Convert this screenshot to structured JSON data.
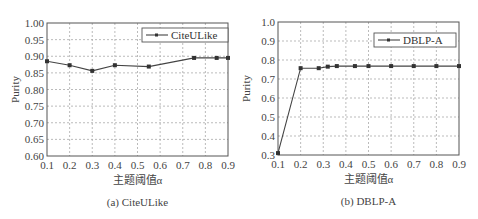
{
  "chart_data": [
    {
      "type": "line",
      "title": "",
      "caption": "(a) CiteULike",
      "xlabel": "主题阈值α",
      "ylabel": "Purity",
      "xlim": [
        0.1,
        0.9
      ],
      "ylim": [
        0.6,
        1.0
      ],
      "xticks": [
        "0.1",
        "0.2",
        "0.3",
        "0.4",
        "0.5",
        "0.6",
        "0.7",
        "0.8",
        "0.9"
      ],
      "yticks": [
        "0.60",
        "0.65",
        "0.70",
        "0.75",
        "0.80",
        "0.85",
        "0.90",
        "0.95",
        "1.00"
      ],
      "grid": true,
      "legend_position": "upper right",
      "series": [
        {
          "name": "CiteULike",
          "x": [
            0.1,
            0.2,
            0.3,
            0.4,
            0.55,
            0.75,
            0.85,
            0.9
          ],
          "values": [
            0.885,
            0.873,
            0.856,
            0.873,
            0.869,
            0.895,
            0.895,
            0.895
          ]
        }
      ]
    },
    {
      "type": "line",
      "title": "",
      "caption": "(b) DBLP-A",
      "xlabel": "主题阈值α",
      "ylabel": "Purity",
      "xlim": [
        0.1,
        0.9
      ],
      "ylim": [
        0.3,
        1.0
      ],
      "xticks": [
        "0.1",
        "0.2",
        "0.3",
        "0.4",
        "0.5",
        "0.6",
        "0.7",
        "0.8",
        "0.9"
      ],
      "yticks": [
        "0.3",
        "0.4",
        "0.5",
        "0.6",
        "0.7",
        "0.8",
        "0.9",
        "1.0"
      ],
      "grid": true,
      "legend_position": "upper right",
      "series": [
        {
          "name": "DBLP-A",
          "x": [
            0.1,
            0.2,
            0.28,
            0.32,
            0.36,
            0.44,
            0.5,
            0.6,
            0.7,
            0.8,
            0.9
          ],
          "values": [
            0.31,
            0.757,
            0.757,
            0.765,
            0.768,
            0.768,
            0.768,
            0.768,
            0.768,
            0.768,
            0.768
          ]
        }
      ]
    }
  ]
}
